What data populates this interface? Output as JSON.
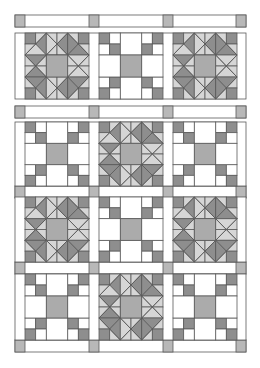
{
  "diagram": {
    "type": "quilt-layout",
    "grid": {
      "rows": 4,
      "cols": 3
    },
    "rows": [
      [
        "star",
        "ninepatch",
        "star"
      ],
      [
        "ninepatch",
        "star",
        "ninepatch"
      ],
      [
        "star",
        "ninepatch",
        "star"
      ],
      [
        "ninepatch",
        "star",
        "ninepatch"
      ]
    ],
    "colors": {
      "line": "#5a5a5a",
      "background": "#ffffff",
      "dark": "#8e8e8e",
      "medium": "#ababab",
      "light": "#d6d6d6",
      "cornerstone": "#b8b8b8"
    }
  }
}
